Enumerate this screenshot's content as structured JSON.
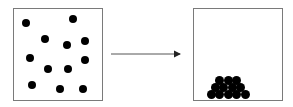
{
  "diagram": {
    "title": "",
    "left_panel": {
      "label": "dispersed particles",
      "dots": [
        [
          26,
          23
        ],
        [
          73,
          19
        ],
        [
          45,
          39
        ],
        [
          67,
          45
        ],
        [
          85,
          41
        ],
        [
          30,
          58
        ],
        [
          48,
          69
        ],
        [
          68,
          69
        ],
        [
          85,
          60
        ],
        [
          32,
          85
        ],
        [
          60,
          89
        ],
        [
          83,
          89
        ],
        [
          45,
          39
        ]
      ]
    },
    "arrow": {
      "label": "transition",
      "color": "#333333"
    },
    "right_panel": {
      "label": "settled particles",
      "rows": [
        3,
        4,
        5
      ]
    },
    "colors": {
      "dot": "#000000",
      "border": "#7a7a7a"
    }
  }
}
